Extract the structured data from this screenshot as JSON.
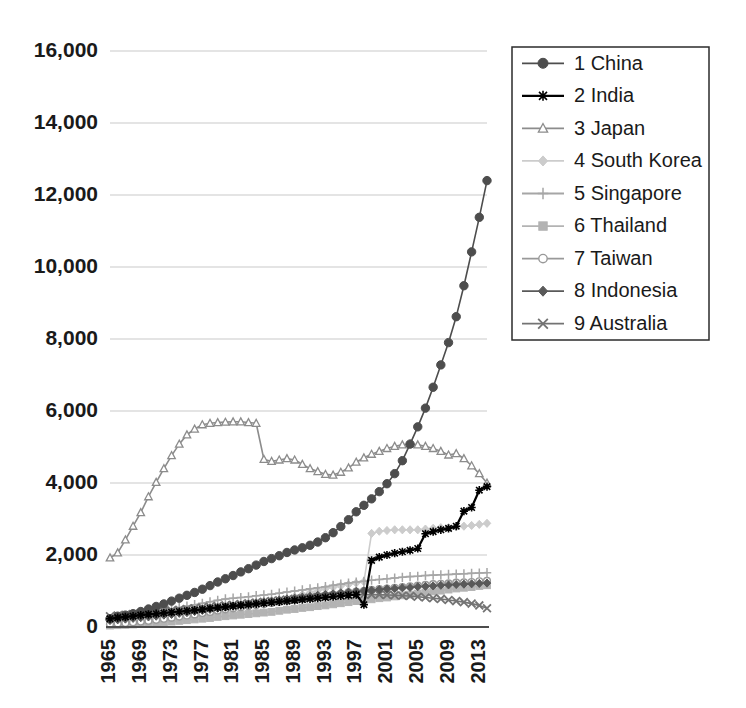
{
  "chart_data": {
    "type": "line",
    "title": "",
    "subtitle": "",
    "xlabel": "",
    "ylabel": "",
    "xlim": [
      1965,
      2014
    ],
    "ylim": [
      0,
      16000
    ],
    "grid": true,
    "legend_position": "top-right",
    "y_ticks": [
      "0",
      "2,000",
      "4,000",
      "6,000",
      "8,000",
      "10,000",
      "12,000",
      "14,000",
      "16,000"
    ],
    "y_tick_values": [
      0,
      2000,
      4000,
      6000,
      8000,
      10000,
      12000,
      14000,
      16000
    ],
    "x_ticks": [
      "1965",
      "1969",
      "1973",
      "1977",
      "1981",
      "1985",
      "1989",
      "1993",
      "1997",
      "2001",
      "2005",
      "2009",
      "2013"
    ],
    "x_tick_values": [
      1965,
      1969,
      1973,
      1977,
      1981,
      1985,
      1989,
      1993,
      1997,
      2001,
      2005,
      2009,
      2013
    ],
    "x": [
      1965,
      1966,
      1967,
      1968,
      1969,
      1970,
      1971,
      1972,
      1973,
      1974,
      1975,
      1976,
      1977,
      1978,
      1979,
      1980,
      1981,
      1982,
      1983,
      1984,
      1985,
      1986,
      1987,
      1988,
      1989,
      1990,
      1991,
      1992,
      1993,
      1994,
      1995,
      1996,
      1997,
      1998,
      1999,
      2000,
      2001,
      2002,
      2003,
      2004,
      2005,
      2006,
      2007,
      2008,
      2009,
      2010,
      2011,
      2012,
      2013,
      2014
    ],
    "series": [
      {
        "name": "1 China",
        "legend_label": "1 China",
        "rank": 1,
        "color": "#4d4d4d",
        "marker": "circle",
        "values": [
          230,
          300,
          330,
          370,
          430,
          500,
          570,
          640,
          720,
          800,
          880,
          960,
          1050,
          1150,
          1250,
          1340,
          1430,
          1530,
          1620,
          1720,
          1820,
          1900,
          1980,
          2070,
          2140,
          2200,
          2270,
          2360,
          2480,
          2620,
          2790,
          2980,
          3200,
          3380,
          3560,
          3760,
          3980,
          4260,
          4620,
          5080,
          5560,
          6080,
          6660,
          7280,
          7900,
          8620,
          9480,
          10420,
          11380,
          12400
        ]
      },
      {
        "name": "2 India",
        "legend_label": "2 India",
        "rank": 2,
        "color": "#000000",
        "marker": "asterisk",
        "values": [
          230,
          260,
          280,
          300,
          330,
          350,
          370,
          390,
          410,
          430,
          450,
          470,
          490,
          520,
          540,
          560,
          580,
          600,
          620,
          640,
          660,
          680,
          700,
          720,
          740,
          760,
          780,
          800,
          820,
          840,
          860,
          880,
          900,
          620,
          1850,
          1940,
          2000,
          2050,
          2090,
          2130,
          2180,
          2590,
          2650,
          2700,
          2740,
          2800,
          3220,
          3320,
          3800,
          3900
        ]
      },
      {
        "name": "3 Japan",
        "legend_label": "3 Japan",
        "rank": 3,
        "color": "#8c8c8c",
        "marker": "triangle",
        "values": [
          1920,
          2060,
          2420,
          2800,
          3180,
          3620,
          4020,
          4400,
          4760,
          5080,
          5340,
          5500,
          5620,
          5660,
          5680,
          5690,
          5700,
          5700,
          5680,
          5660,
          4660,
          4600,
          4640,
          4680,
          4640,
          4520,
          4400,
          4320,
          4240,
          4220,
          4300,
          4420,
          4580,
          4700,
          4800,
          4880,
          4960,
          5020,
          5060,
          5080,
          5060,
          5020,
          4960,
          4880,
          4780,
          4820,
          4680,
          4480,
          4260,
          4000
        ]
      },
      {
        "name": "4 South Korea",
        "legend_label": "4 South Korea",
        "rank": 4,
        "color": "#cccccc",
        "marker": "diamond",
        "values": [
          60,
          70,
          80,
          95,
          110,
          130,
          150,
          170,
          200,
          230,
          260,
          290,
          330,
          370,
          410,
          440,
          470,
          500,
          540,
          580,
          620,
          670,
          720,
          780,
          840,
          900,
          960,
          1010,
          1060,
          1100,
          1140,
          1180,
          1220,
          1260,
          2600,
          2660,
          2680,
          2700,
          2700,
          2700,
          2700,
          2720,
          2740,
          2760,
          2760,
          2780,
          2800,
          2820,
          2850,
          2880
        ]
      },
      {
        "name": "5 Singapore",
        "legend_label": "5 Singapore",
        "rank": 5,
        "color": "#a6a6a6",
        "marker": "plus",
        "values": [
          210,
          240,
          270,
          300,
          340,
          380,
          420,
          460,
          500,
          540,
          580,
          620,
          660,
          700,
          740,
          780,
          800,
          820,
          840,
          870,
          890,
          910,
          940,
          970,
          1000,
          1030,
          1060,
          1090,
          1120,
          1160,
          1190,
          1220,
          1250,
          1270,
          1300,
          1320,
          1340,
          1360,
          1380,
          1400,
          1410,
          1430,
          1440,
          1450,
          1460,
          1470,
          1480,
          1490,
          1500,
          1510
        ]
      },
      {
        "name": "6 Thailand",
        "legend_label": "6 Thailand",
        "rank": 6,
        "color": "#b3b3b3",
        "marker": "square",
        "values": [
          40,
          50,
          60,
          70,
          80,
          95,
          110,
          130,
          150,
          170,
          190,
          210,
          230,
          250,
          280,
          300,
          320,
          340,
          360,
          380,
          400,
          420,
          450,
          480,
          500,
          530,
          550,
          580,
          600,
          630,
          660,
          690,
          720,
          740,
          770,
          800,
          820,
          850,
          880,
          900,
          930,
          960,
          990,
          1010,
          1040,
          1070,
          1090,
          1110,
          1140,
          1160
        ]
      },
      {
        "name": "7 Taiwan",
        "legend_label": "7 Taiwan",
        "rank": 7,
        "color": "#999999",
        "marker": "circle-open",
        "values": [
          80,
          95,
          110,
          130,
          150,
          175,
          200,
          230,
          260,
          290,
          320,
          350,
          390,
          420,
          460,
          490,
          520,
          550,
          580,
          610,
          640,
          670,
          700,
          730,
          760,
          790,
          820,
          850,
          880,
          900,
          930,
          960,
          980,
          1000,
          1030,
          1050,
          1070,
          1090,
          1110,
          1130,
          1150,
          1170,
          1190,
          1200,
          1210,
          1230,
          1240,
          1250,
          1270,
          1280
        ]
      },
      {
        "name": "8 Indonesia",
        "legend_label": "8 Indonesia",
        "rank": 8,
        "color": "#595959",
        "marker": "diamond-filled",
        "values": [
          180,
          200,
          220,
          240,
          260,
          280,
          300,
          330,
          350,
          380,
          400,
          430,
          460,
          490,
          520,
          550,
          580,
          610,
          640,
          670,
          700,
          720,
          750,
          780,
          800,
          830,
          850,
          880,
          900,
          920,
          950,
          970,
          990,
          1010,
          1020,
          1040,
          1060,
          1070,
          1090,
          1100,
          1120,
          1130,
          1140,
          1160,
          1170,
          1180,
          1190,
          1200,
          1210,
          1220
        ]
      },
      {
        "name": "9 Australia",
        "legend_label": "9 Australia",
        "rank": 9,
        "color": "#737373",
        "marker": "x",
        "values": [
          300,
          320,
          340,
          360,
          380,
          400,
          420,
          440,
          460,
          480,
          500,
          520,
          540,
          560,
          580,
          600,
          620,
          640,
          660,
          680,
          700,
          720,
          740,
          760,
          780,
          800,
          810,
          830,
          840,
          860,
          870,
          880,
          890,
          900,
          900,
          900,
          890,
          880,
          870,
          860,
          840,
          820,
          800,
          780,
          750,
          720,
          690,
          650,
          600,
          520
        ]
      }
    ]
  },
  "legend": {
    "items": [
      {
        "label": "1 China"
      },
      {
        "label": "2 India"
      },
      {
        "label": "3 Japan"
      },
      {
        "label": "4 South Korea"
      },
      {
        "label": "5 Singapore"
      },
      {
        "label": "6 Thailand"
      },
      {
        "label": "7 Taiwan"
      },
      {
        "label": "8 Indonesia"
      },
      {
        "label": "9 Australia"
      }
    ]
  }
}
